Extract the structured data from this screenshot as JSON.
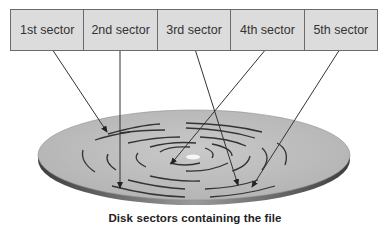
{
  "sectors": [
    {
      "label": "1st sector"
    },
    {
      "label": "2nd sector"
    },
    {
      "label": "3rd sector"
    },
    {
      "label": "4th sector"
    },
    {
      "label": "5th sector"
    }
  ],
  "caption": "Disk sectors containing the file",
  "colors": {
    "sector_fill": "#dcdcdc",
    "sector_border": "#6b6b6b",
    "disk_top": "#bdbdbd",
    "disk_edge": "#5a5a5a",
    "track": "#3a3a3a",
    "arrow": "#333333"
  }
}
